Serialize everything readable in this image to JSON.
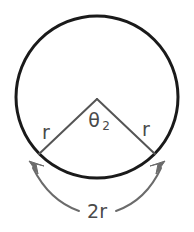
{
  "figure": {
    "background_color": "#ffffff",
    "circle": {
      "stroke_color": "#1a1a1a",
      "stroke_width": 3,
      "center_x": 97,
      "center_y": 97,
      "radius": 81,
      "fill": "none"
    },
    "radii": {
      "stroke_color": "#555555",
      "stroke_width": 2,
      "left_label": "r",
      "right_label": "r",
      "left_endpoint_x": 39,
      "left_endpoint_y": 154,
      "right_endpoint_x": 155,
      "right_endpoint_y": 154,
      "vertex_x": 97,
      "vertex_y": 99
    },
    "angle": {
      "symbol": "θ",
      "subscript": "2",
      "full_label": "θ₂",
      "color": "#4a4a4a"
    },
    "chord_arrow": {
      "label": "2r",
      "stroke_color": "#6b6b6b",
      "stroke_width": 2,
      "arrowheads": "both",
      "left_arrow_direction": "up-left",
      "right_arrow_direction": "up-right"
    },
    "labels": {
      "left_r": "r",
      "right_r": "r",
      "chord": "2r"
    }
  }
}
